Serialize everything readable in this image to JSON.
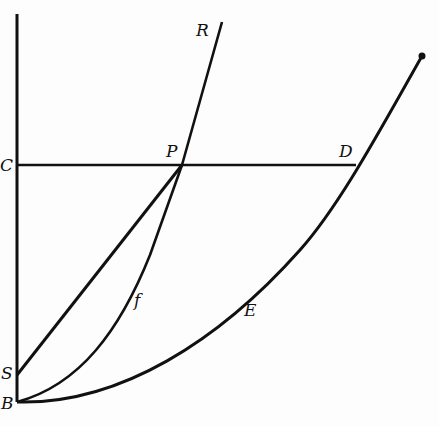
{
  "diagram": {
    "stroke_color": "#111111",
    "background": "#fdfdfd",
    "labels": {
      "R": "R",
      "C": "C",
      "P": "P",
      "D": "D",
      "f": "f",
      "E": "E",
      "S": "S",
      "B": "B"
    },
    "elements": [
      "vertical axis through C, S, B",
      "horizontal line C to D through P",
      "straight line S to P",
      "curve B-f-P continuing to R",
      "curve B-E-D extending upward beyond D"
    ]
  }
}
